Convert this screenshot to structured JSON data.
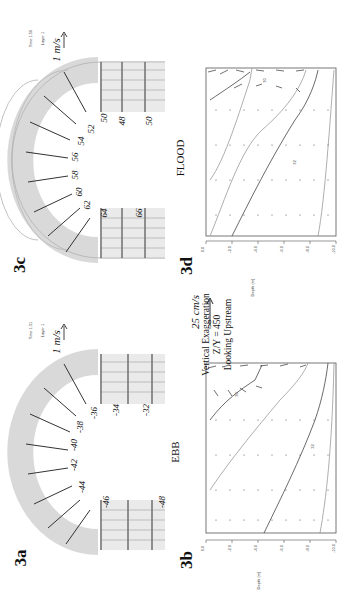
{
  "figure": {
    "orientation": "rotated 90 degrees counter-clockwise",
    "panels": {
      "3a": {
        "label": "3a",
        "condition": "EBB",
        "time_label": "Time 1.31",
        "layer_label": "Layer 1",
        "scale_label": "1 m/s",
        "contour_labels": [
          "-32",
          "-34",
          "-36",
          "-38",
          "-40",
          "-42",
          "-44",
          "-46",
          "-48"
        ]
      },
      "3b": {
        "label": "3b",
        "ylabel": "Depth (m)",
        "yticks": [
          "0.0",
          "-2.0",
          "-4.0",
          "-6.0",
          "-8.0",
          "-10.0",
          "-12.0"
        ],
        "contour_labels": [
          "30",
          "32"
        ]
      },
      "3c": {
        "label": "3c",
        "condition": "FLOOD",
        "time_label": "Time 1.56",
        "layer_label": "Layer 1",
        "scale_label": "1 m/s",
        "contour_labels": [
          "50",
          "48",
          "50",
          "52",
          "54",
          "56",
          "58",
          "60",
          "62",
          "64",
          "66"
        ]
      },
      "3d": {
        "label": "3d",
        "ylabel": "Depth (m)",
        "yticks": [
          "0.0",
          "-2.0",
          "-4.0",
          "-6.0",
          "-8.0",
          "-10.0",
          "-12.0"
        ],
        "contour_labels": [
          "30",
          "32"
        ]
      }
    },
    "center_annotation": {
      "scale_label": "25 cm/s",
      "lines": [
        "Vertical Exaggeration",
        "Z/Y = 450",
        "Looking Upstream"
      ]
    }
  }
}
